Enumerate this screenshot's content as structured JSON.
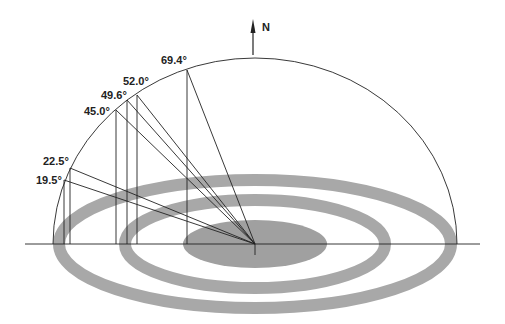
{
  "diagram": {
    "type": "sun-path-hemisphere",
    "north_label": "N",
    "colors": {
      "line": "#222222",
      "ring": "#a8a8a8",
      "center_disc": "#999999",
      "background": "#ffffff"
    },
    "angles": [
      {
        "label": "69.4°",
        "value": 69.4
      },
      {
        "label": "52.0°",
        "value": 52.0
      },
      {
        "label": "49.6°",
        "value": 49.6
      },
      {
        "label": "45.0°",
        "value": 45.0
      },
      {
        "label": "22.5°",
        "value": 22.5
      },
      {
        "label": "19.5°",
        "value": 19.5
      }
    ]
  }
}
